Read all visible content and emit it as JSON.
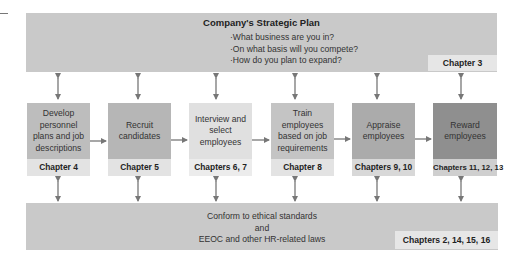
{
  "strategic_plan": {
    "title": "Company's Strategic Plan",
    "questions": [
      "·What business are you in?",
      "·On what basis will you compete?",
      "·How do you plan to expand?"
    ],
    "chapter": "Chapter 3"
  },
  "steps": [
    {
      "label": "Develop personnel plans and job descriptions",
      "chapter": "Chapter 4"
    },
    {
      "label": "Recruit candidates",
      "chapter": "Chapter 5"
    },
    {
      "label": "Interview and select employees",
      "chapter": "Chapters 6, 7"
    },
    {
      "label": "Train employees based on job requirements",
      "chapter": "Chapter 8"
    },
    {
      "label": "Appraise employees",
      "chapter": "Chapters 9, 10"
    },
    {
      "label": "Reward employees",
      "chapter": "Chapters 11, 12, 13"
    }
  ],
  "compliance": {
    "lines": [
      "Conform to ethical standards",
      "and",
      "EEOC and other HR-related laws"
    ],
    "chapter": "Chapters 2, 14, 15, 16"
  },
  "colors": {
    "bar": "#c9c9c9",
    "arrow": "#777777"
  }
}
